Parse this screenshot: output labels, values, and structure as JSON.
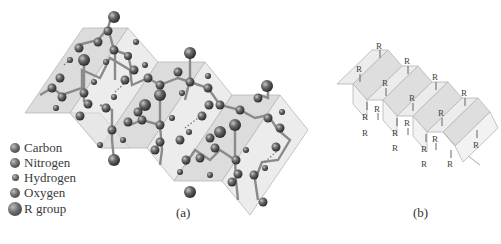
{
  "figure": {
    "panel_a": {
      "caption": "(a)",
      "description": "Ball-and-stick model of beta-pleated sheet",
      "legend": [
        {
          "label": "Carbon",
          "size": 10
        },
        {
          "label": "Nitrogen",
          "size": 10
        },
        {
          "label": "Hydrogen",
          "size": 7
        },
        {
          "label": "Oxygen",
          "size": 10
        },
        {
          "label": "R group",
          "size": 14
        }
      ]
    },
    "panel_b": {
      "caption": "(b)",
      "description": "Schematic pleated sheet with R groups",
      "r_label": "R"
    },
    "colors": {
      "sheet_fill": "#e6e6e6",
      "sheet_dark": "#cfcfcf",
      "sheet_edge": "#b8b8b8",
      "atom": "#5c5c5c",
      "bond": "#8a8a8a"
    }
  }
}
